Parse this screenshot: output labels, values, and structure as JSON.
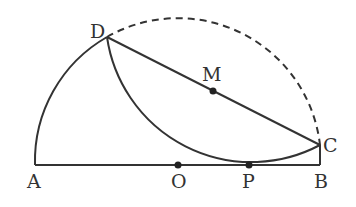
{
  "diagram": {
    "type": "geometry-folded-semicircle",
    "stroke_color": "#333333",
    "labels": {
      "A": "A",
      "O": "O",
      "P": "P",
      "B": "B",
      "C": "C",
      "D": "D",
      "M": "M"
    },
    "points": {
      "A": [
        35,
        165
      ],
      "O": [
        178,
        165
      ],
      "P": [
        249,
        165
      ],
      "B": [
        320,
        165
      ],
      "C": [
        320,
        145
      ],
      "D": [
        107,
        37
      ],
      "M": [
        213,
        91
      ]
    },
    "elements": [
      "diameter AB",
      "segment BC",
      "chord DC with midpoint M",
      "arc AD (solid, part of semicircle)",
      "arc DC (dashed, original semicircle)",
      "folded arc DC tangent to AB at P"
    ]
  }
}
